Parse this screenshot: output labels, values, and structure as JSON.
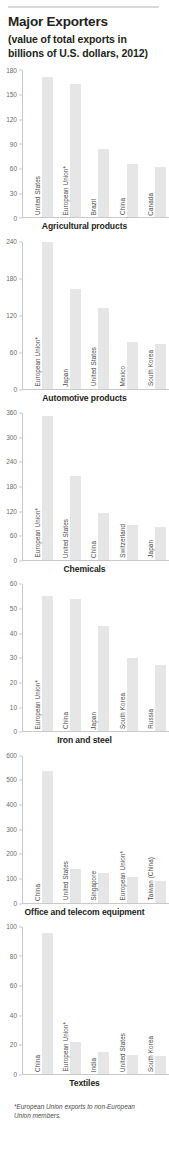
{
  "header": {
    "title": "Major Exporters",
    "subtitle": "(value of total exports in billions of U.S. dollars, 2012)"
  },
  "footnote": "*European Union exports to non-European Union members.",
  "colors": {
    "bar": "#e6e6e6",
    "axis": "#c9c9c9",
    "text": "#231f20",
    "tick_text": "#6d6d6d"
  },
  "chart_data": [
    {
      "type": "bar",
      "title": "Agricultural products",
      "xlabel": "",
      "ylabel": "",
      "ylim": [
        0,
        180
      ],
      "yticks": [
        0,
        30,
        60,
        90,
        120,
        150,
        180
      ],
      "grid": false,
      "legend": "none",
      "categories": [
        "United States",
        "European Union*",
        "Brazil",
        "China",
        "Canada"
      ],
      "values": [
        172,
        163,
        84,
        65,
        61
      ]
    },
    {
      "type": "bar",
      "title": "Automotive products",
      "xlabel": "",
      "ylabel": "",
      "ylim": [
        0,
        240
      ],
      "yticks": [
        0,
        60,
        120,
        180,
        240
      ],
      "grid": false,
      "legend": "none",
      "categories": [
        "European Union*",
        "Japan",
        "United States",
        "Mexico",
        "South Korea"
      ],
      "values": [
        240,
        162,
        132,
        76,
        73
      ]
    },
    {
      "type": "bar",
      "title": "Chemicals",
      "xlabel": "",
      "ylabel": "",
      "ylim": [
        0,
        360
      ],
      "yticks": [
        0,
        60,
        120,
        180,
        240,
        300,
        360
      ],
      "grid": false,
      "legend": "none",
      "categories": [
        "European Union*",
        "United States",
        "China",
        "Switzerland",
        "Japan"
      ],
      "values": [
        352,
        205,
        115,
        85,
        80
      ]
    },
    {
      "type": "bar",
      "title": "Iron and steel",
      "xlabel": "",
      "ylabel": "",
      "ylim": [
        0,
        60
      ],
      "yticks": [
        0,
        10,
        20,
        30,
        40,
        50,
        60
      ],
      "grid": false,
      "legend": "none",
      "categories": [
        "European Union*",
        "China",
        "Japan",
        "South Korea",
        "Russia"
      ],
      "values": [
        55,
        54,
        43,
        30,
        27
      ]
    },
    {
      "type": "bar",
      "title": "Office and telecom equipment",
      "xlabel": "",
      "ylabel": "",
      "ylim": [
        0,
        600
      ],
      "yticks": [
        0,
        100,
        200,
        300,
        400,
        500,
        600
      ],
      "grid": false,
      "legend": "none",
      "categories": [
        "China",
        "United States",
        "Singapore",
        "European Union*",
        "Taiwan (China)"
      ],
      "values": [
        535,
        138,
        120,
        103,
        88
      ]
    },
    {
      "type": "bar",
      "title": "Textiles",
      "xlabel": "",
      "ylabel": "",
      "ylim": [
        0,
        100
      ],
      "yticks": [
        0,
        20,
        40,
        60,
        80,
        100
      ],
      "grid": false,
      "legend": "none",
      "categories": [
        "China",
        "European Union*",
        "India",
        "United States",
        "South Korea"
      ],
      "values": [
        96,
        22,
        15,
        13,
        12
      ]
    }
  ]
}
